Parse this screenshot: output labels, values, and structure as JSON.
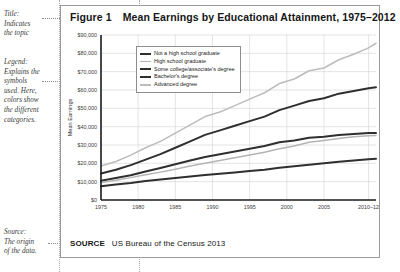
{
  "annotations": {
    "title_note": "Title:\nIndicates\nthe topic",
    "legend_note": "Legend:\nExplains the\nsymbols\nused. Here,\ncolors show\nthe different\ncategories.",
    "source_note": "Source:\nThe origin\nof the data."
  },
  "figure": {
    "number": "Figure 1",
    "title": "Mean Earnings by Educational Attainment, 1975–2012"
  },
  "source": {
    "label": "SOURCE",
    "text": "US Bureau of the Census 2013"
  },
  "legend": {
    "items": [
      {
        "label": "Not a high school graduate",
        "color": "#2f2f2f",
        "weight": 2.2
      },
      {
        "label": "High school graduate",
        "color": "#b4b4b4",
        "weight": 1.6
      },
      {
        "label": "Some college/associate's degree",
        "color": "#2f2f2f",
        "weight": 2.2
      },
      {
        "label": "Bachelor's degree",
        "color": "#2f2f2f",
        "weight": 2.2
      },
      {
        "label": "Advanced degree",
        "color": "#bcbcbc",
        "weight": 1.6
      }
    ]
  },
  "chart_data": {
    "type": "line",
    "title": "Mean Earnings by Educational Attainment, 1975–2012",
    "xlabel": "",
    "ylabel": "Mean Earnings",
    "ylim": [
      0,
      90000
    ],
    "ytick_labels": [
      "$0",
      "$10,000",
      "$20,000",
      "$30,000",
      "$40,000",
      "$50,000",
      "$60,000",
      "$70,000",
      "$80,000",
      "$90,000"
    ],
    "ytick_values": [
      0,
      10000,
      20000,
      30000,
      40000,
      50000,
      60000,
      70000,
      80000,
      90000
    ],
    "xtick_labels": [
      "1975",
      "1980",
      "1985",
      "1990",
      "1995",
      "2000",
      "2005",
      "2010–12"
    ],
    "xtick_values": [
      1975,
      1980,
      1985,
      1990,
      1995,
      2000,
      2005,
      2011
    ],
    "xlim": [
      1975,
      2012
    ],
    "grid": true,
    "legend_position": "upper-left-inside",
    "x": [
      1975,
      1977,
      1979,
      1981,
      1983,
      1985,
      1987,
      1989,
      1991,
      1993,
      1995,
      1997,
      1999,
      2001,
      2003,
      2005,
      2007,
      2009,
      2011,
      2012
    ],
    "series": [
      {
        "name": "Advanced degree",
        "color": "#bcbcbc",
        "values": [
          18500,
          21000,
          24500,
          28500,
          32000,
          36500,
          41000,
          45500,
          48000,
          51500,
          55000,
          58500,
          63500,
          66000,
          70500,
          72000,
          76500,
          79500,
          83000,
          85500
        ]
      },
      {
        "name": "Bachelor's degree",
        "color": "#2f2f2f",
        "values": [
          14500,
          16500,
          19000,
          22000,
          25000,
          28500,
          32000,
          35500,
          38000,
          40500,
          43000,
          45500,
          49000,
          51500,
          54000,
          55500,
          58000,
          59500,
          61000,
          61500
        ]
      },
      {
        "name": "Some college/associate's degree",
        "color": "#2f2f2f",
        "values": [
          10500,
          12000,
          13500,
          15500,
          17500,
          19500,
          21500,
          23500,
          25000,
          26500,
          28000,
          29500,
          31500,
          32500,
          34000,
          34500,
          35500,
          36000,
          36500,
          36500
        ]
      },
      {
        "name": "High school graduate",
        "color": "#b4b4b4",
        "values": [
          9500,
          10800,
          12200,
          13800,
          15200,
          16800,
          18500,
          20000,
          21500,
          23000,
          24500,
          26000,
          28000,
          29500,
          31500,
          32500,
          33500,
          34500,
          35000,
          35200
        ]
      },
      {
        "name": "Not a high school graduate",
        "color": "#2f2f2f",
        "values": [
          7500,
          8400,
          9300,
          10400,
          11200,
          12000,
          12800,
          13600,
          14300,
          15000,
          15800,
          16500,
          17600,
          18400,
          19200,
          20000,
          20800,
          21500,
          22200,
          22500
        ]
      }
    ]
  }
}
